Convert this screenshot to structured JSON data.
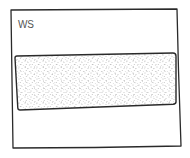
{
  "sketch": {
    "frame_label": "WS",
    "colors": {
      "ink": "#2a2a2a",
      "label": "#555555",
      "stipple": "#7a7a7a",
      "background": "#ffffff"
    },
    "frame": {
      "points": [
        [
          11,
          10
        ],
        [
          177,
          9
        ],
        [
          181,
          146
        ],
        [
          13,
          148
        ]
      ]
    },
    "content_block": {
      "fill": "stippled",
      "points": [
        [
          15,
          56
        ],
        [
          175,
          53
        ],
        [
          176,
          104
        ],
        [
          18,
          110
        ]
      ]
    }
  }
}
